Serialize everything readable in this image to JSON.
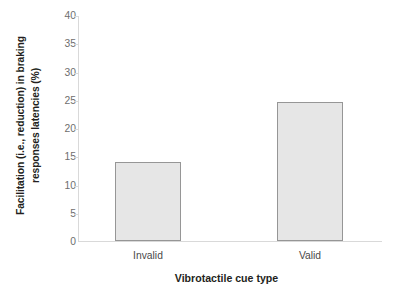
{
  "chart_data": {
    "type": "bar",
    "title": "",
    "categories": [
      "Invalid",
      "Valid"
    ],
    "values": [
      13.9,
      24.6
    ],
    "series": [
      {
        "name": "Facilitation",
        "values": [
          13.9,
          24.6
        ]
      }
    ],
    "xlabel": "Vibrotactile cue type",
    "ylabel_line1": "Facilitation (i.e., reduction) in braking",
    "ylabel_line2": "responses latencies (%)",
    "ylabel": "Facilitation (i.e., reduction) in braking responses latencies (%)",
    "ylim": [
      0,
      40
    ],
    "ytick_step": 5,
    "yticks": [
      "40",
      "35",
      "30",
      "25",
      "20",
      "15",
      "10",
      "5",
      "0"
    ],
    "ytick_values": [
      40,
      35,
      30,
      25,
      20,
      15,
      10,
      5,
      0
    ],
    "grid": false,
    "legend": "none",
    "colors": {
      "bar_fill": "#e6e6e6",
      "bar_border": "#969696",
      "axis": "#d9d9d9",
      "tick_label": "#6e6e6e",
      "title_text": "#231f20",
      "background": "#ffffff"
    }
  }
}
